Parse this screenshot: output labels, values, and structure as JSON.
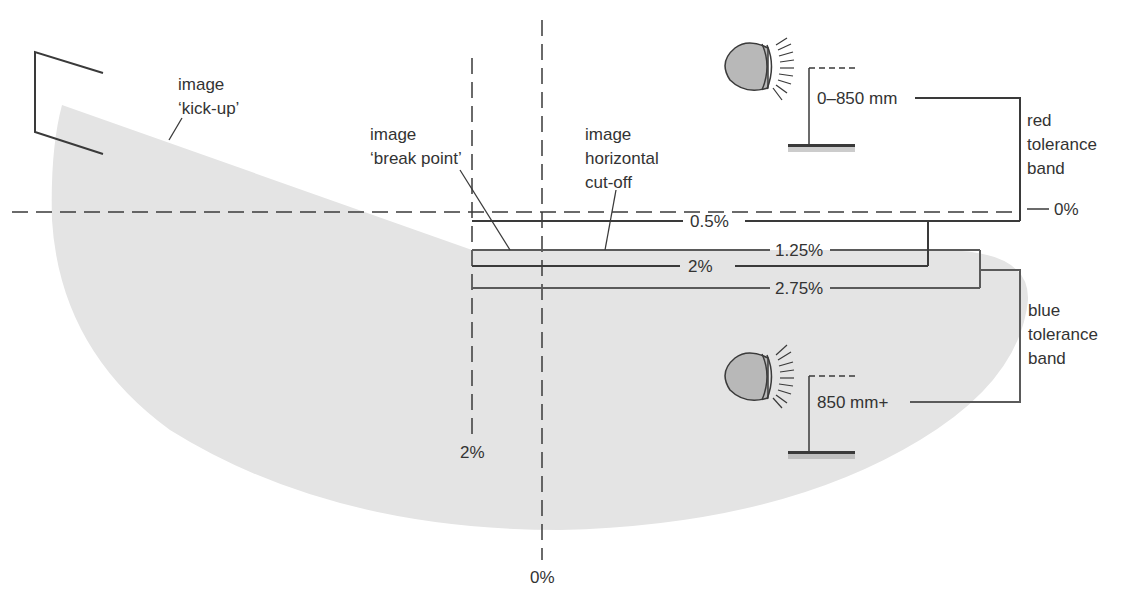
{
  "colors": {
    "beam": "#e4e4e4",
    "line_dark": "#3a3a3a",
    "line_mid": "#5a5a5a",
    "text": "#333333",
    "lamp_fill": "#b8b8b8"
  },
  "labels": {
    "kick_up": {
      "line1": "image",
      "line2": "‘kick-up’"
    },
    "break_point": {
      "line1": "image",
      "line2": "‘break point’"
    },
    "horizontal_cutoff": {
      "line1": "image",
      "line2": "horizontal",
      "line3": "cut-off"
    },
    "red_band": {
      "line1": "red",
      "line2": "tolerance",
      "line3": "band"
    },
    "blue_band": {
      "line1": "blue",
      "line2": "tolerance",
      "line3": "band"
    },
    "height_low": "0–850 mm",
    "height_high": "850 mm+",
    "horizontal_zero": "0%",
    "vertical_zero": "0%",
    "vertical_two": "2%"
  },
  "percent_lines": [
    {
      "label": "0.5%",
      "band": "red"
    },
    {
      "label": "1.25%",
      "band": "blue"
    },
    {
      "label": "2%",
      "band": "red"
    },
    {
      "label": "2.75%",
      "band": "blue"
    }
  ]
}
